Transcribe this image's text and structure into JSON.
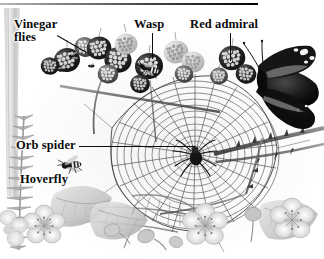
{
  "figure": {
    "kind": "grayscale natural history illustration",
    "width": 324,
    "height": 259,
    "background": "#ffffff",
    "ink": "#0a0a0a",
    "rule": {
      "name": "top-rule",
      "x": 0,
      "y": 3,
      "width": 258,
      "height": 2,
      "color_light": "#b9b9b9",
      "color_dark": "#000000"
    }
  },
  "labels": [
    {
      "id": "vinegar-flies",
      "text_line1": "Vinegar",
      "text_line2": "flies",
      "text": "Vinegar flies",
      "x": 14,
      "y": 18,
      "leader": {
        "type": "diagonal",
        "x": 57,
        "y": 35,
        "length": 36,
        "angle": 30
      }
    },
    {
      "id": "wasp",
      "text": "Wasp",
      "x": 134,
      "y": 18,
      "leader": {
        "type": "vertical",
        "x": 152,
        "y": 33,
        "length": 26
      }
    },
    {
      "id": "red-admiral",
      "text": "Red admiral",
      "x": 190,
      "y": 18,
      "leader": {
        "type": "vertical",
        "x": 230,
        "y": 33,
        "length": 28
      }
    },
    {
      "id": "orb-spider",
      "text": "Orb spider",
      "x": 16,
      "y": 139,
      "leader": {
        "type": "horizontal",
        "x": 79,
        "y": 146,
        "length": 116
      }
    },
    {
      "id": "hoverfly",
      "text": "Hoverfly",
      "x": 20,
      "y": 173,
      "leader": null
    }
  ],
  "scene": {
    "elements": [
      {
        "name": "grass-stalk-left",
        "description": "tall pale vertical grass blade at far left edge"
      },
      {
        "name": "foxglove-spike-left",
        "description": "spiky seed-head stalk lower left"
      },
      {
        "name": "blackberry-cluster",
        "description": "cluster of ripe and unripe blackberries across the top"
      },
      {
        "name": "orb-web",
        "description": "large spiral orb web filling the centre"
      },
      {
        "name": "orb-spider",
        "description": "dark spider at the hub of the web"
      },
      {
        "name": "red-admiral-butterfly",
        "description": "dark butterfly with white wing spots at upper right"
      },
      {
        "name": "wasp-insect",
        "description": "small wasp on a berry, centre top"
      },
      {
        "name": "vinegar-flies-insect",
        "description": "tiny flies on berries at upper left"
      },
      {
        "name": "hoverfly-insect",
        "description": "small striped hoverfly mid left"
      },
      {
        "name": "bramble-stem",
        "description": "thorny arching bramble cane on the right"
      },
      {
        "name": "bramble-flowers",
        "description": "pale five-petalled bramble flowers along the bottom"
      },
      {
        "name": "flower-buds",
        "description": "round unopened buds on thin stalks at bottom"
      },
      {
        "name": "bramble-leaves",
        "description": "toothed leaves at lower left and lower right"
      }
    ]
  }
}
